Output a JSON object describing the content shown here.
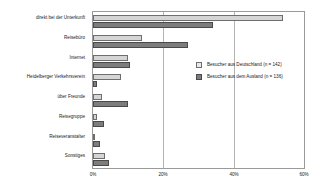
{
  "chart_data": {
    "type": "bar",
    "orientation": "horizontal",
    "title": "",
    "xlabel": "",
    "ylabel": "",
    "xlim": [
      0,
      60
    ],
    "xticks": [
      0,
      20,
      40,
      60
    ],
    "xticklabels": [
      "0%",
      "20%",
      "40%",
      "60%"
    ],
    "grid": true,
    "legend_position": "inside-right",
    "categories": [
      "direkt bei der Unterkunft",
      "Reisebüro",
      "Internet",
      "Heidelberger Verkehrsverein",
      "über Freunde",
      "Reisegruppe",
      "Reiseveranstalter",
      "Sonstiges"
    ],
    "series": [
      {
        "name": "Besucher aus Deutschland (n = 142)",
        "color": "#d5d5d5",
        "values": [
          54,
          14,
          10,
          8,
          2.5,
          1,
          0.3,
          3.5
        ]
      },
      {
        "name": "Besucher aus dem Ausland (n = 136)",
        "color": "#7d7d7d",
        "values": [
          34,
          27,
          10.5,
          1,
          10,
          3,
          2,
          4.5
        ]
      }
    ]
  },
  "legend": {
    "items": [
      {
        "label": "Besucher aus Deutschland (n = 142)",
        "swatch": "light"
      },
      {
        "label": "Besucher aus dem Ausland (n = 136)",
        "swatch": "dark"
      }
    ]
  }
}
